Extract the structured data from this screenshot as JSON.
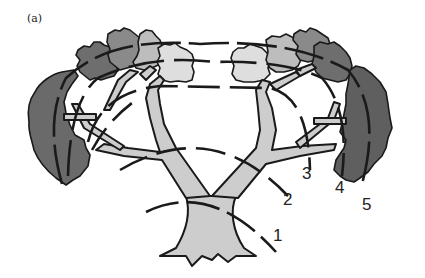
{
  "figure": {
    "panel_label": "(a)",
    "colors": {
      "background": "#ffffff",
      "outline": "#1a1a1a",
      "wood": "#cdcdcd",
      "foliage_level_light": "#dedede",
      "foliage_level_mid_light": "#bdbdbd",
      "foliage_level_mid_dark": "#8a8a8a",
      "foliage_level_dark": "#6a6a6a"
    },
    "shell_labels": [
      {
        "id": 1,
        "text": "1"
      },
      {
        "id": 2,
        "text": "2"
      },
      {
        "id": 3,
        "text": "3"
      },
      {
        "id": 4,
        "text": "4"
      },
      {
        "id": 5,
        "text": "5"
      }
    ]
  }
}
